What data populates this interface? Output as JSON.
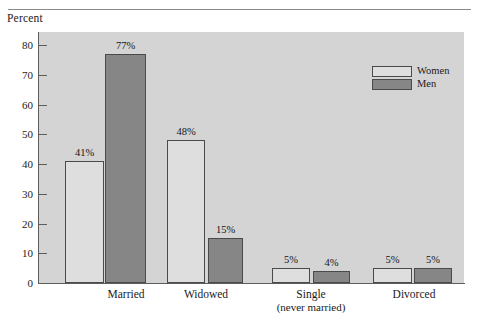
{
  "chart_data": {
    "type": "bar",
    "title": "",
    "ylabel": "Percent",
    "xlabel": "",
    "ylim": [
      0,
      85
    ],
    "yticks": [
      0,
      10,
      20,
      30,
      40,
      50,
      60,
      70,
      80
    ],
    "ytick_labels": [
      "0",
      "10",
      "20",
      "30",
      "40",
      "50",
      "60",
      "70",
      "80"
    ],
    "grid": false,
    "legend_position": "top-right",
    "categories": [
      "Married",
      "Widowed",
      "Single\n(never married)",
      "Divorced"
    ],
    "category_labels": [
      {
        "line1": "Married",
        "line2": ""
      },
      {
        "line1": "Widowed",
        "line2": ""
      },
      {
        "line1": "Single",
        "line2": "(never married)"
      },
      {
        "line1": "Divorced",
        "line2": ""
      }
    ],
    "series": [
      {
        "name": "Women",
        "color": "#dedede",
        "values": [
          41,
          48,
          5,
          5
        ],
        "data_labels": [
          "41%",
          "48%",
          "5%",
          "5%"
        ]
      },
      {
        "name": "Men",
        "color": "#868686",
        "values": [
          77,
          15,
          4,
          5
        ],
        "data_labels": [
          "77%",
          "15%",
          "4%",
          "5%"
        ]
      }
    ]
  },
  "legend": {
    "items": [
      {
        "label": "Women",
        "swatch": "women-swatch"
      },
      {
        "label": "Men",
        "swatch": "men-swatch"
      }
    ]
  },
  "axis": {
    "y_caption": "Percent"
  }
}
